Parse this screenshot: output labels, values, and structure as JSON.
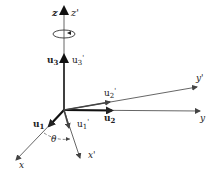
{
  "diagram": {
    "title": "",
    "colors": {
      "axis": "#444444",
      "unit_vector": "#111111",
      "rotated": "#555555",
      "background": "#ffffff"
    },
    "axes": [
      {
        "id": "z",
        "label": "z",
        "primed_label": "z'"
      },
      {
        "id": "x",
        "label": "x"
      },
      {
        "id": "x_prime",
        "label": "x'"
      },
      {
        "id": "y",
        "label": "y"
      },
      {
        "id": "y_prime",
        "label": "y'"
      }
    ],
    "unit_vectors": [
      {
        "id": "u1",
        "label": "u",
        "sub": "1",
        "prime": ""
      },
      {
        "id": "u1_prime",
        "label": "u",
        "sub": "1",
        "prime": "'"
      },
      {
        "id": "u2",
        "label": "u",
        "sub": "2",
        "prime": ""
      },
      {
        "id": "u2_prime",
        "label": "u",
        "sub": "2",
        "prime": "'"
      },
      {
        "id": "u3",
        "label": "u",
        "sub": "3",
        "prime": ""
      },
      {
        "id": "u3_prime",
        "label": "u",
        "sub": "3",
        "prime": "'"
      }
    ],
    "angle": {
      "label": "θ"
    },
    "rotation_marker": "rotation about z-axis"
  }
}
